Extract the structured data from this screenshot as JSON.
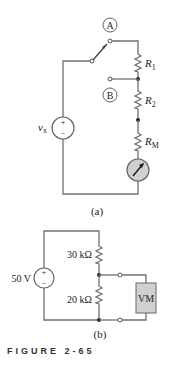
{
  "circuit_a": {
    "switch_label_a": "A",
    "terminal_label_b": "B",
    "r1": {
      "name": "R",
      "sub": "1"
    },
    "r2": {
      "name": "R",
      "sub": "2"
    },
    "rm": {
      "name": "R",
      "sub": "M"
    },
    "source": {
      "name": "v",
      "sub": "x",
      "plus": "+",
      "minus": "−"
    },
    "meter": "analog-meter-icon",
    "caption": "(a)"
  },
  "circuit_b": {
    "source": {
      "value": "50 V",
      "plus": "+",
      "minus": "−"
    },
    "r_top": "30 kΩ",
    "r_bottom": "20 kΩ",
    "meter_label": "VM",
    "caption": "(b)"
  },
  "figure_caption": "FIGURE 2-65",
  "colors": {
    "wire": "#707070",
    "meter_fill": "#d0d0d0",
    "text": "#222222"
  }
}
